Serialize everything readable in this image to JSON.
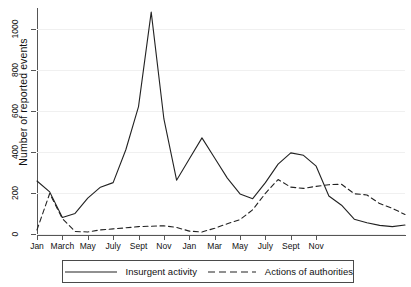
{
  "chart_data": {
    "type": "line",
    "title": "",
    "xlabel": "",
    "ylabel": "Number of reported events",
    "ylim": [
      0,
      1100
    ],
    "yticks": [
      0,
      200,
      400,
      600,
      800,
      1000
    ],
    "ytick_labels": [
      "0",
      "200",
      "400",
      "600",
      "800",
      "1000"
    ],
    "grid": true,
    "legend_position": "below-plot",
    "x_tick_labels": [
      "Jan",
      "March",
      "May",
      "July",
      "Sept",
      "Nov",
      "Jan",
      "Mar",
      "May",
      "July",
      "Sept",
      "Nov"
    ],
    "x_tick_indices": [
      0,
      2,
      4,
      6,
      8,
      10,
      12,
      14,
      16,
      18,
      20,
      22
    ],
    "x": [
      0,
      1,
      2,
      3,
      4,
      5,
      6,
      7,
      8,
      9,
      10,
      11,
      12,
      13,
      14,
      15,
      16,
      17,
      18,
      19,
      20,
      21,
      22,
      23
    ],
    "series": [
      {
        "name": "Insurgent activity",
        "style": "solid",
        "color": "#222222",
        "values": [
          258,
          205,
          80,
          100,
          175,
          228,
          250,
          410,
          620,
          1080,
          560,
          262,
          365,
          468,
          370,
          272,
          195,
          172,
          250,
          340,
          395,
          383,
          330,
          185
        ]
      },
      {
        "name": "Actions of authorities",
        "style": "dashed",
        "color": "#222222",
        "values": [
          20,
          197,
          75,
          12,
          10,
          20,
          25,
          30,
          36,
          38,
          40,
          32,
          14,
          10,
          28,
          50,
          70,
          118,
          198,
          265,
          228,
          222,
          232,
          240
        ]
      }
    ],
    "series_tail": {
      "note": "curves continue to right edge",
      "insurgent": [
        140,
        72,
        55,
        42,
        36,
        44
      ],
      "authorities": [
        242,
        196,
        190,
        148,
        125,
        95
      ]
    }
  },
  "legend": {
    "entries": [
      {
        "label": "Insurgent activity",
        "style": "solid"
      },
      {
        "label": "Actions of authorities",
        "style": "dashed"
      }
    ]
  }
}
